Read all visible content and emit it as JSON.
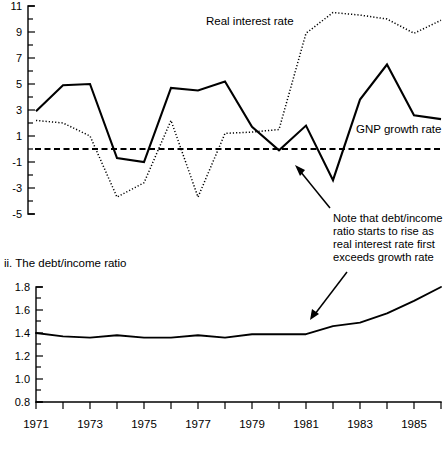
{
  "figure": {
    "background_color": "#ffffff",
    "ink_color": "#000000"
  },
  "panels": {
    "top": {
      "title": "",
      "series_labels": {
        "real_interest": "Real interest rate",
        "gnp_growth": "GNP growth rate"
      },
      "y_tick_labels": [
        "11",
        "9",
        "7",
        "5",
        "3",
        "1",
        "-1",
        "-3",
        "-5"
      ]
    },
    "bottom": {
      "title": "ii.  The debt/income ratio",
      "y_tick_labels": [
        "1.8",
        "1.6",
        "1.4",
        "1.2",
        "1.0",
        "0.8"
      ],
      "x_tick_labels": [
        "1971",
        "1973",
        "1975",
        "1977",
        "1979",
        "1981",
        "1983",
        "1985"
      ]
    }
  },
  "annotation": {
    "lines": [
      "Note that debt/income",
      "ratio starts to rise as",
      "real interest rate first",
      "exceeds growth rate"
    ]
  },
  "chart_data": [
    {
      "type": "line",
      "title": "",
      "xlabel": "",
      "ylabel": "",
      "xlim": [
        1971,
        1986
      ],
      "ylim": [
        -5,
        11
      ],
      "y_ticks_major": [
        -5,
        -3,
        -1,
        1,
        3,
        5,
        7,
        9,
        11
      ],
      "y_ticks_minor_step": 1,
      "grid": false,
      "legend": "inline-labels",
      "x": [
        1971,
        1972,
        1973,
        1974,
        1975,
        1976,
        1977,
        1978,
        1979,
        1980,
        1981,
        1982,
        1983,
        1984,
        1985,
        1986
      ],
      "series": [
        {
          "name": "GNP growth rate",
          "style": "solid",
          "values": [
            2.9,
            4.9,
            5.0,
            -0.7,
            -1.0,
            4.7,
            4.5,
            5.2,
            1.7,
            -0.1,
            1.8,
            -2.4,
            3.8,
            6.5,
            2.6,
            2.3
          ]
        },
        {
          "name": "Real interest rate",
          "style": "dotted",
          "values": [
            2.2,
            2.0,
            1.0,
            -3.7,
            -2.6,
            2.2,
            -3.7,
            1.2,
            1.3,
            1.5,
            8.9,
            10.5,
            10.3,
            10.0,
            8.9,
            9.9
          ]
        },
        {
          "name": "zero reference",
          "style": "dashed",
          "values": [
            0,
            0,
            0,
            0,
            0,
            0,
            0,
            0,
            0,
            0,
            0,
            0,
            0,
            0,
            0,
            0
          ]
        }
      ]
    },
    {
      "type": "line",
      "title": "ii.  The debt/income ratio",
      "xlabel": "",
      "ylabel": "",
      "xlim": [
        1971,
        1986
      ],
      "ylim": [
        0.8,
        1.8
      ],
      "y_ticks_major": [
        0.8,
        1.0,
        1.2,
        1.4,
        1.6,
        1.8
      ],
      "y_ticks_minor_step": 0.1,
      "grid": false,
      "x": [
        1971,
        1972,
        1973,
        1974,
        1975,
        1976,
        1977,
        1978,
        1979,
        1980,
        1981,
        1982,
        1983,
        1984,
        1985,
        1986
      ],
      "series": [
        {
          "name": "debt/income ratio",
          "style": "solid",
          "values": [
            1.4,
            1.37,
            1.36,
            1.38,
            1.36,
            1.36,
            1.38,
            1.36,
            1.39,
            1.39,
            1.39,
            1.46,
            1.49,
            1.57,
            1.68,
            1.8
          ]
        }
      ]
    }
  ]
}
